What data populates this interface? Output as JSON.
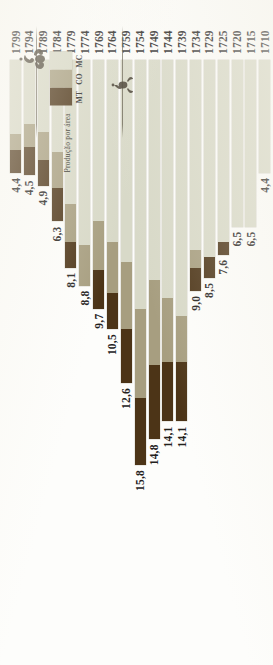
{
  "legend": {
    "title": "Produção por área",
    "keys": [
      {
        "code": "MT",
        "color": "#4c3417"
      },
      {
        "code": "CO",
        "color": "#a79e80"
      },
      {
        "code": "MC",
        "color": "#d8d9c8"
      }
    ]
  },
  "chart_data": {
    "type": "bar",
    "title": "Produção por área",
    "orientation": "horizontal-stacked",
    "xlabel": "",
    "ylabel": "",
    "categories": [
      "1799",
      "1794",
      "1789",
      "1784",
      "1779",
      "1774",
      "1769",
      "1764",
      "1759",
      "1754",
      "1749",
      "1744",
      "1739",
      "1734",
      "1729",
      "1725",
      "1720",
      "1715",
      "1710"
    ],
    "value_labels": [
      "4,4",
      "4,5",
      "4,9",
      "6,3",
      "8,1",
      "8,8",
      "9,7",
      "10,5",
      "12,6",
      "15,8",
      "14,8",
      "14,1",
      "14,1",
      "9,0",
      "8,5",
      "7,6",
      "6,5",
      "6,5",
      "4,4"
    ],
    "totals": [
      4.4,
      4.5,
      4.9,
      6.3,
      8.1,
      8.8,
      9.7,
      10.5,
      12.6,
      15.8,
      14.8,
      14.1,
      14.1,
      9.0,
      8.5,
      7.6,
      6.5,
      6.5,
      4.4
    ],
    "series": [
      {
        "name": "MT",
        "color": "#4c3417",
        "values": [
          0.9,
          1.1,
          1.0,
          1.3,
          1.0,
          0.0,
          1.5,
          1.4,
          2.1,
          2.6,
          2.9,
          2.3,
          2.3,
          0.9,
          0.8,
          0.5,
          0.0,
          0.0,
          0.0
        ]
      },
      {
        "name": "CO",
        "color": "#a79e80",
        "values": [
          0.6,
          0.9,
          1.1,
          1.4,
          1.5,
          1.6,
          1.9,
          2.0,
          2.6,
          3.5,
          3.3,
          2.5,
          1.8,
          0.7,
          0.0,
          0.0,
          0.0,
          0.0,
          0.0
        ]
      },
      {
        "name": "MC",
        "color": "#d8d9c8",
        "values": [
          2.9,
          2.5,
          2.8,
          3.6,
          5.6,
          7.2,
          6.3,
          7.1,
          7.9,
          9.7,
          8.6,
          9.3,
          10.0,
          7.4,
          7.7,
          7.1,
          6.5,
          6.5,
          4.4
        ]
      }
    ],
    "xlim": [
      0,
      15.8
    ],
    "grid": false,
    "legend_position": "top-left"
  }
}
